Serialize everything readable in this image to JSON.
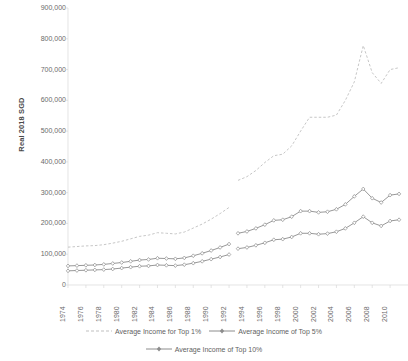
{
  "chart_data": {
    "type": "line",
    "title": "",
    "xlabel": "",
    "ylabel": "Real 2018 SGD",
    "ylim": [
      0,
      900000
    ],
    "ytick_labels": [
      "900,000",
      "800,000",
      "700,000",
      "600,000",
      "500,000",
      "400,000",
      "300,000",
      "200,000",
      "100,000",
      "0"
    ],
    "ytick_values": [
      900000,
      800000,
      700000,
      600000,
      500000,
      400000,
      300000,
      200000,
      100000,
      0
    ],
    "xtick_labels": [
      "1974",
      "1976",
      "1978",
      "1980",
      "1982",
      "1984",
      "1986",
      "1988",
      "1990",
      "1992",
      "1994",
      "1996",
      "1998",
      "2000",
      "2002",
      "2004",
      "2006",
      "2008",
      "2010"
    ],
    "xlim": [
      1974,
      2012
    ],
    "grid": false,
    "legend_position": "bottom",
    "note": "Series are broken between 1992 and 1993; chart is cropped at the right edge after 2011",
    "series": [
      {
        "name": "Average Income for Top 1%",
        "color": "#bfbfbf",
        "marker": "none",
        "x": [
          1974,
          1975,
          1976,
          1977,
          1978,
          1979,
          1980,
          1981,
          1982,
          1983,
          1984,
          1985,
          1986,
          1987,
          1988,
          1989,
          1990,
          1991,
          1992,
          null,
          1993,
          1994,
          1995,
          1996,
          1997,
          1998,
          1999,
          2000,
          2001,
          2002,
          2003,
          2004,
          2005,
          2006,
          2007,
          2008,
          2009,
          2010,
          2011
        ],
        "values": [
          123000,
          125000,
          127000,
          128000,
          131000,
          136000,
          142000,
          150000,
          158000,
          162000,
          170000,
          168000,
          166000,
          172000,
          185000,
          198000,
          214000,
          232000,
          252000,
          null,
          340000,
          352000,
          372000,
          398000,
          420000,
          425000,
          452000,
          500000,
          545000,
          545000,
          545000,
          552000,
          600000,
          660000,
          778000,
          690000,
          655000,
          700000,
          706000
        ]
      },
      {
        "name": "Average Income of Top 5%",
        "color": "#8c8c8c",
        "marker": "diamond",
        "x": [
          1974,
          1975,
          1976,
          1977,
          1978,
          1979,
          1980,
          1981,
          1982,
          1983,
          1984,
          1985,
          1986,
          1987,
          1988,
          1989,
          1990,
          1991,
          1992,
          null,
          1993,
          1994,
          1995,
          1996,
          1997,
          1998,
          1999,
          2000,
          2001,
          2002,
          2003,
          2004,
          2005,
          2006,
          2007,
          2008,
          2009,
          2010,
          2011
        ],
        "values": [
          62000,
          63000,
          64000,
          65000,
          67000,
          70000,
          73000,
          77000,
          81000,
          83000,
          87000,
          86000,
          85000,
          88000,
          95000,
          103000,
          112000,
          122000,
          133000,
          null,
          168000,
          174000,
          184000,
          196000,
          210000,
          212000,
          222000,
          240000,
          240000,
          236000,
          238000,
          246000,
          262000,
          288000,
          312000,
          282000,
          268000,
          292000,
          296000
        ],
        "values_label": "approximate, read off axis"
      },
      {
        "name": "Average Income of Top 10%",
        "color": "#8c8c8c",
        "marker": "diamond",
        "x": [
          1974,
          1975,
          1976,
          1977,
          1978,
          1979,
          1980,
          1981,
          1982,
          1983,
          1984,
          1985,
          1986,
          1987,
          1988,
          1989,
          1990,
          1991,
          1992,
          null,
          1993,
          1994,
          1995,
          1996,
          1997,
          1998,
          1999,
          2000,
          2001,
          2002,
          2003,
          2004,
          2005,
          2006,
          2007,
          2008,
          2009,
          2010,
          2011
        ],
        "values": [
          46000,
          47000,
          48000,
          49000,
          50000,
          52000,
          55000,
          58000,
          61000,
          62000,
          65000,
          64000,
          63000,
          66000,
          71000,
          77000,
          84000,
          91000,
          99000,
          null,
          118000,
          122000,
          129000,
          137000,
          147000,
          149000,
          156000,
          168000,
          168000,
          165000,
          167000,
          173000,
          184000,
          202000,
          222000,
          202000,
          192000,
          208000,
          212000
        ]
      }
    ]
  },
  "legend": {
    "items": [
      {
        "label": "Average Income for Top 1%"
      },
      {
        "label": "Average Income of Top 5%"
      },
      {
        "label": "Average Income of Top 10%"
      }
    ]
  }
}
